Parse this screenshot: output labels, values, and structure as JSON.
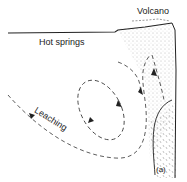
{
  "diagram": {
    "labels": {
      "volcano": "Volcano",
      "hot_springs": "Hot springs",
      "leaching": "Leaching",
      "panel": "(a)"
    },
    "colors": {
      "line": "#222222",
      "stipple": "#888888",
      "background": "#ffffff"
    }
  }
}
